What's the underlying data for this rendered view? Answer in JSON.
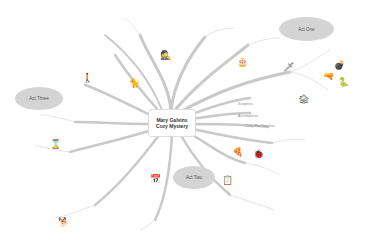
{
  "center": {
    "line1": "Mary Galvins",
    "line2": "Cozy Mystery"
  },
  "acts": [
    {
      "label": "Act One",
      "x": 279,
      "y": 17,
      "w": 55,
      "h": 24
    },
    {
      "label": "Act Three",
      "x": 15,
      "y": 87,
      "w": 48,
      "h": 23
    },
    {
      "label": "Act Two",
      "x": 173,
      "y": 166,
      "w": 42,
      "h": 23
    }
  ],
  "branch_labels": [
    {
      "text": "Suspects",
      "x": 238,
      "y": 102
    },
    {
      "text": "Accomplices",
      "x": 238,
      "y": 114
    },
    {
      "text": "Cozy Plot Timeline",
      "x": 245,
      "y": 124
    },
    {
      "text": "Yes",
      "x": 248,
      "y": 98
    }
  ],
  "icons": [
    {
      "name": "detective-icon",
      "glyph": "🕵",
      "x": 160,
      "y": 51
    },
    {
      "name": "cake-icon",
      "glyph": "🎂",
      "x": 237,
      "y": 58
    },
    {
      "name": "knife-icon",
      "glyph": "🗡",
      "x": 283,
      "y": 63
    },
    {
      "name": "bomb-icon",
      "glyph": "💣",
      "x": 334,
      "y": 61
    },
    {
      "name": "gun-icon",
      "glyph": "🔫",
      "x": 323,
      "y": 72
    },
    {
      "name": "snake-icon",
      "glyph": "🐍",
      "x": 338,
      "y": 78
    },
    {
      "name": "house-icon",
      "glyph": "🏚",
      "x": 298,
      "y": 95
    },
    {
      "name": "person-icon",
      "glyph": "🚶",
      "x": 82,
      "y": 74
    },
    {
      "name": "cat-icon",
      "glyph": "🐈",
      "x": 129,
      "y": 79
    },
    {
      "name": "detective-small-icon",
      "glyph": "🕵",
      "x": 90,
      "y": 69
    },
    {
      "name": "hourglass-icon",
      "glyph": "⌛",
      "x": 50,
      "y": 140
    },
    {
      "name": "pizza-icon",
      "glyph": "🍕",
      "x": 232,
      "y": 148
    },
    {
      "name": "bug-icon",
      "glyph": "🐞",
      "x": 253,
      "y": 150
    },
    {
      "name": "clipboard-icon",
      "glyph": "📋",
      "x": 222,
      "y": 176
    },
    {
      "name": "calendar-icon",
      "glyph": "📅",
      "x": 150,
      "y": 175
    },
    {
      "name": "dog-icon",
      "glyph": "🐕",
      "x": 58,
      "y": 218
    }
  ]
}
